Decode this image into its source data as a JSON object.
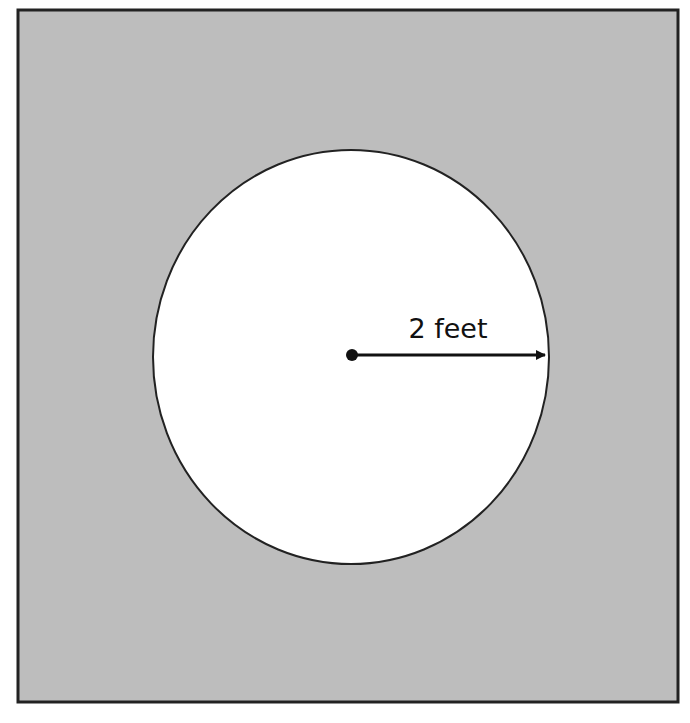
{
  "diagram": {
    "type": "geometry",
    "square": {
      "fill": "#bdbdbd",
      "stroke": "#222222",
      "x": 18,
      "y": 10,
      "width": 660,
      "height": 692
    },
    "circle": {
      "fill": "#ffffff",
      "stroke": "#222222",
      "cx": 351,
      "cy": 357,
      "rx": 198,
      "ry": 207
    },
    "radius": {
      "label": "2 feet",
      "value": 2,
      "unit": "feet",
      "start": [
        352,
        355
      ],
      "end": [
        546,
        355
      ],
      "color": "#111111"
    }
  }
}
